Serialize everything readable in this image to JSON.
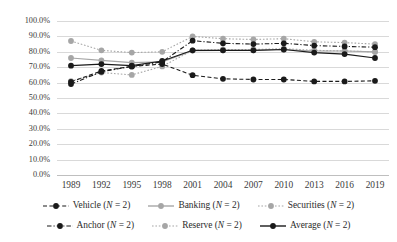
{
  "chart_data": {
    "type": "line",
    "title": "",
    "xlabel": "",
    "ylabel": "",
    "ylim": [
      0,
      100
    ],
    "ytick_labels": [
      "100.0%",
      "90.0%",
      "80.0%",
      "70.0%",
      "60.0%",
      "50.0%",
      "40.0%",
      "30.0%",
      "20.0%",
      "10.0%",
      "0.0%"
    ],
    "ytick_values": [
      100,
      90,
      80,
      70,
      60,
      50,
      40,
      30,
      20,
      10,
      0
    ],
    "grid": true,
    "legend_position": "bottom",
    "categories": [
      "1989",
      "1992",
      "1995",
      "1998",
      "2001",
      "2004",
      "2007",
      "2010",
      "2013",
      "2016",
      "2019"
    ],
    "x": [
      1989,
      1992,
      1995,
      1998,
      2001,
      2004,
      2007,
      2010,
      2013,
      2016,
      2019
    ],
    "series": [
      {
        "name": "Vehicle (N = 2)",
        "label": "Vehicle",
        "n_label": "(N = 2)",
        "color": "#1a1a1a",
        "style": "dashed",
        "marker": "circle",
        "values": [
          60.5,
          67.5,
          70.5,
          72.0,
          64.8,
          62.5,
          62.0,
          62.0,
          60.8,
          60.8,
          61.2
        ]
      },
      {
        "name": "Banking (N = 2)",
        "label": "Banking",
        "n_label": "(N = 2)",
        "color": "#a6a6a6",
        "style": "solid",
        "marker": "circle",
        "values": [
          76.0,
          74.5,
          73.0,
          73.5,
          80.8,
          81.0,
          81.0,
          81.5,
          80.5,
          80.5,
          80.0
        ]
      },
      {
        "name": "Securities (N = 2)",
        "label": "Securities",
        "n_label": "(N = 2)",
        "color": "#a6a6a6",
        "style": "dotted",
        "marker": "circle",
        "values": [
          61.0,
          66.5,
          65.0,
          70.5,
          81.0,
          81.5,
          81.5,
          82.0,
          81.0,
          80.5,
          80.0
        ]
      },
      {
        "name": "Anchor (N = 2)",
        "label": "Anchor",
        "n_label": "(N = 2)",
        "color": "#1a1a1a",
        "style": "dashdot",
        "marker": "circle",
        "values": [
          59.0,
          67.0,
          70.5,
          73.5,
          87.2,
          85.5,
          85.0,
          85.5,
          84.0,
          83.5,
          83.0
        ]
      },
      {
        "name": "Reserve (N = 2)",
        "label": "Reserve",
        "n_label": "(N = 2)",
        "color": "#a6a6a6",
        "style": "dotted",
        "marker": "circle",
        "values": [
          87.0,
          81.0,
          79.5,
          80.0,
          90.0,
          88.5,
          88.0,
          88.5,
          86.5,
          86.0,
          85.0
        ]
      },
      {
        "name": "Average (N = 2)",
        "label": "Average",
        "n_label": "(N = 2)",
        "color": "#1a1a1a",
        "style": "solid",
        "marker": "circle",
        "values": [
          71.0,
          72.0,
          71.0,
          74.0,
          81.0,
          81.0,
          81.0,
          81.5,
          79.5,
          78.5,
          76.0
        ]
      }
    ]
  }
}
